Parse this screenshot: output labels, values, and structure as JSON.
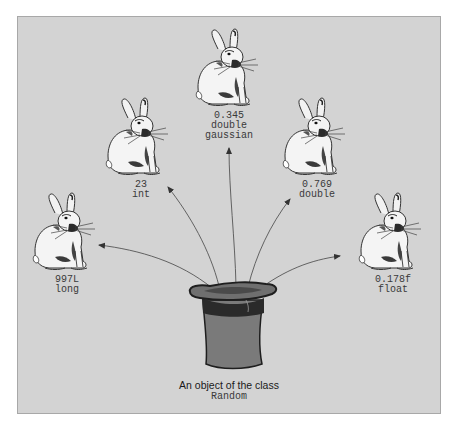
{
  "diagram": {
    "source": {
      "caption_line1": "An object of the class",
      "caption_line2": "Random",
      "icon": "top-hat-icon"
    },
    "outputs": [
      {
        "value": "997L",
        "type": "long",
        "icon": "rabbit-icon"
      },
      {
        "value": "23",
        "type": "int",
        "icon": "rabbit-icon"
      },
      {
        "value": "0.345",
        "type": "double",
        "type2": "gaussian",
        "icon": "rabbit-icon"
      },
      {
        "value": "0.769",
        "type": "double",
        "icon": "rabbit-icon"
      },
      {
        "value": "0.178f",
        "type": "float",
        "icon": "rabbit-icon"
      }
    ]
  },
  "colors": {
    "panel_bg": "#d3d3d3",
    "hat_body": "#7a7a7a",
    "hat_band": "#2a2a2a",
    "arrow": "#555555",
    "text": "#3a3a3a"
  }
}
